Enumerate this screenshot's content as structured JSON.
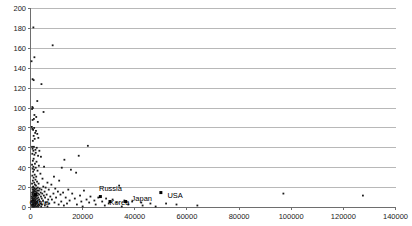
{
  "chart_data": {
    "type": "scatter",
    "title": "",
    "subtitle": "",
    "xlabel": "",
    "ylabel": "",
    "xlim": [
      0,
      140000
    ],
    "ylim": [
      0,
      200
    ],
    "grid": true,
    "grid_axis": "y",
    "legend": "none",
    "xticks": [
      0,
      20000,
      40000,
      60000,
      80000,
      100000,
      120000,
      140000
    ],
    "xticklabels": [
      "0",
      "20000",
      "40000",
      "60000",
      "80000",
      "100000",
      "120000",
      "140000"
    ],
    "yticks": [
      0,
      20,
      40,
      60,
      80,
      100,
      120,
      140,
      160,
      180,
      200
    ],
    "yticklabels": [
      "0",
      "20",
      "40",
      "60",
      "80",
      "100",
      "120",
      "140",
      "160",
      "180",
      "200"
    ],
    "annotations": [
      {
        "text": "China",
        "x": 1900,
        "y": 12,
        "dx": -6,
        "dy": 6
      },
      {
        "text": "Russia",
        "x": 25500,
        "y": 17,
        "dx": 2,
        "dy": -3
      },
      {
        "text": "Korea",
        "x": 29500,
        "y": 9,
        "dx": 2,
        "dy": 3
      },
      {
        "text": "Japan",
        "x": 38000,
        "y": 10,
        "dx": 2,
        "dy": 0
      },
      {
        "text": "USA",
        "x": 51000,
        "y": 14,
        "dx": 4,
        "dy": 1
      }
    ],
    "highlight_points": [
      {
        "name": "China",
        "x": 1900,
        "y": 13
      },
      {
        "name": "Russia",
        "x": 26800,
        "y": 11
      },
      {
        "name": "Korea",
        "x": 30500,
        "y": 6
      },
      {
        "name": "Japan",
        "x": 36500,
        "y": 6
      },
      {
        "name": "USA",
        "x": 50000,
        "y": 15
      }
    ],
    "points": [
      [
        1100,
        181
      ],
      [
        8500,
        163
      ],
      [
        400,
        147
      ],
      [
        1500,
        151
      ],
      [
        800,
        129
      ],
      [
        1200,
        128
      ],
      [
        4200,
        124
      ],
      [
        2600,
        107
      ],
      [
        700,
        101
      ],
      [
        900,
        100
      ],
      [
        600,
        99
      ],
      [
        5000,
        96
      ],
      [
        1500,
        93
      ],
      [
        2200,
        91
      ],
      [
        1300,
        89
      ],
      [
        800,
        88
      ],
      [
        2800,
        86
      ],
      [
        500,
        81
      ],
      [
        1400,
        80
      ],
      [
        700,
        79
      ],
      [
        1000,
        78
      ],
      [
        2100,
        77
      ],
      [
        1800,
        75
      ],
      [
        2600,
        74
      ],
      [
        1200,
        72
      ],
      [
        3000,
        70
      ],
      [
        1600,
        69
      ],
      [
        900,
        67
      ],
      [
        22000,
        62
      ],
      [
        600,
        61
      ],
      [
        1300,
        61
      ],
      [
        2400,
        60
      ],
      [
        800,
        59
      ],
      [
        1900,
        58
      ],
      [
        1100,
        57
      ],
      [
        3400,
        57
      ],
      [
        2000,
        55
      ],
      [
        700,
        54
      ],
      [
        1500,
        53
      ],
      [
        18500,
        52
      ],
      [
        2900,
        52
      ],
      [
        4000,
        51
      ],
      [
        1200,
        49
      ],
      [
        13000,
        48
      ],
      [
        900,
        47
      ],
      [
        2300,
        46
      ],
      [
        1700,
        44
      ],
      [
        600,
        43
      ],
      [
        3200,
        42
      ],
      [
        1100,
        41
      ],
      [
        5200,
        41
      ],
      [
        12000,
        40
      ],
      [
        2000,
        40
      ],
      [
        800,
        39
      ],
      [
        1400,
        38
      ],
      [
        15500,
        38
      ],
      [
        2700,
        37
      ],
      [
        1000,
        36
      ],
      [
        17500,
        35
      ],
      [
        3800,
        34
      ],
      [
        1600,
        33
      ],
      [
        700,
        32
      ],
      [
        2200,
        31
      ],
      [
        9000,
        31
      ],
      [
        1200,
        30
      ],
      [
        4600,
        29
      ],
      [
        1900,
        28
      ],
      [
        900,
        27
      ],
      [
        11000,
        27
      ],
      [
        2500,
        26
      ],
      [
        1400,
        25
      ],
      [
        6500,
        25
      ],
      [
        600,
        24
      ],
      [
        3100,
        24
      ],
      [
        1700,
        23
      ],
      [
        8000,
        23
      ],
      [
        34000,
        22
      ],
      [
        2100,
        22
      ],
      [
        1000,
        21
      ],
      [
        4900,
        21
      ],
      [
        1300,
        20
      ],
      [
        2800,
        20
      ],
      [
        5800,
        20
      ],
      [
        700,
        20
      ],
      [
        1600,
        19
      ],
      [
        9500,
        19
      ],
      [
        3500,
        19
      ],
      [
        2300,
        19
      ],
      [
        1100,
        18
      ],
      [
        14500,
        18
      ],
      [
        4200,
        18
      ],
      [
        1900,
        18
      ],
      [
        800,
        18
      ],
      [
        7000,
        18
      ],
      [
        2600,
        17
      ],
      [
        1400,
        17
      ],
      [
        20500,
        17
      ],
      [
        3200,
        17
      ],
      [
        1000,
        16
      ],
      [
        5400,
        16
      ],
      [
        2000,
        16
      ],
      [
        10500,
        16
      ],
      [
        1600,
        16
      ],
      [
        600,
        15
      ],
      [
        3900,
        15
      ],
      [
        2400,
        15
      ],
      [
        12500,
        15
      ],
      [
        1200,
        15
      ],
      [
        8800,
        14
      ],
      [
        1800,
        14
      ],
      [
        4500,
        14
      ],
      [
        900,
        14
      ],
      [
        2900,
        14
      ],
      [
        16000,
        14
      ],
      [
        1400,
        13
      ],
      [
        6200,
        13
      ],
      [
        2200,
        13
      ],
      [
        700,
        13
      ],
      [
        11500,
        13
      ],
      [
        3400,
        13
      ],
      [
        1000,
        12
      ],
      [
        5100,
        12
      ],
      [
        1700,
        12
      ],
      [
        19000,
        12
      ],
      [
        2700,
        12
      ],
      [
        1300,
        11
      ],
      [
        7600,
        11
      ],
      [
        500,
        11
      ],
      [
        4000,
        11
      ],
      [
        2100,
        11
      ],
      [
        23000,
        11
      ],
      [
        1500,
        11
      ],
      [
        9800,
        10
      ],
      [
        3000,
        10
      ],
      [
        800,
        10
      ],
      [
        13500,
        10
      ],
      [
        1900,
        10
      ],
      [
        5600,
        10
      ],
      [
        26000,
        10
      ],
      [
        1100,
        9
      ],
      [
        2500,
        9
      ],
      [
        17000,
        9
      ],
      [
        600,
        9
      ],
      [
        4300,
        9
      ],
      [
        1600,
        9
      ],
      [
        29000,
        9
      ],
      [
        3300,
        8
      ],
      [
        900,
        8
      ],
      [
        8200,
        8
      ],
      [
        2000,
        8
      ],
      [
        21500,
        8
      ],
      [
        1300,
        8
      ],
      [
        6800,
        8
      ],
      [
        31500,
        8
      ],
      [
        2800,
        7
      ],
      [
        700,
        7
      ],
      [
        15000,
        7
      ],
      [
        1700,
        7
      ],
      [
        4800,
        7
      ],
      [
        24500,
        7
      ],
      [
        1000,
        7
      ],
      [
        36000,
        7
      ],
      [
        2300,
        6
      ],
      [
        11800,
        6
      ],
      [
        500,
        6
      ],
      [
        3600,
        6
      ],
      [
        1400,
        6
      ],
      [
        27500,
        6
      ],
      [
        19500,
        6
      ],
      [
        800,
        6
      ],
      [
        39000,
        6
      ],
      [
        5900,
        5
      ],
      [
        2100,
        5
      ],
      [
        1200,
        5
      ],
      [
        33000,
        5
      ],
      [
        9200,
        5
      ],
      [
        1600,
        5
      ],
      [
        42500,
        5
      ],
      [
        600,
        5
      ],
      [
        2600,
        5
      ],
      [
        22500,
        5
      ],
      [
        3900,
        4
      ],
      [
        1000,
        4
      ],
      [
        14000,
        4
      ],
      [
        1900,
        4
      ],
      [
        46000,
        4
      ],
      [
        7200,
        4
      ],
      [
        30000,
        4
      ],
      [
        1400,
        4
      ],
      [
        2400,
        4
      ],
      [
        52000,
        4
      ],
      [
        700,
        3
      ],
      [
        4400,
        3
      ],
      [
        1100,
        3
      ],
      [
        25000,
        3
      ],
      [
        17800,
        3
      ],
      [
        3100,
        3
      ],
      [
        56000,
        3
      ],
      [
        900,
        3
      ],
      [
        2000,
        3
      ],
      [
        37500,
        3
      ],
      [
        10800,
        3
      ],
      [
        1500,
        2
      ],
      [
        5500,
        2
      ],
      [
        600,
        2
      ],
      [
        2700,
        2
      ],
      [
        43000,
        2
      ],
      [
        1200,
        2
      ],
      [
        12800,
        2
      ],
      [
        3400,
        2
      ],
      [
        800,
        2
      ],
      [
        28500,
        2
      ],
      [
        1800,
        2
      ],
      [
        64000,
        2
      ],
      [
        2200,
        1
      ],
      [
        6500,
        1
      ],
      [
        1000,
        1
      ],
      [
        20000,
        1
      ],
      [
        4100,
        1
      ],
      [
        1300,
        1
      ],
      [
        48000,
        1
      ],
      [
        2900,
        1
      ],
      [
        700,
        1
      ],
      [
        35000,
        1
      ],
      [
        1600,
        1
      ],
      [
        97000,
        14
      ],
      [
        127500,
        12
      ]
    ]
  }
}
